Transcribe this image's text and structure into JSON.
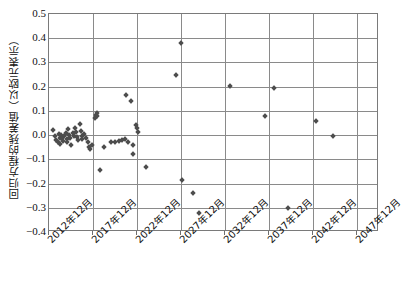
{
  "chart_data": {
    "type": "scatter",
    "title": "",
    "xlabel": "",
    "ylabel": "回归方程的残差值（以欧元表示）",
    "ylim": [
      -0.4,
      0.5
    ],
    "yticks": [
      "0.5",
      "0.4",
      "0.3",
      "0.2",
      "0.1",
      "0.0",
      "-0.1",
      "-0.2",
      "-0.3",
      "-0.4"
    ],
    "ytick_values": [
      0.5,
      0.4,
      0.3,
      0.2,
      0.1,
      0.0,
      -0.1,
      -0.2,
      -0.3,
      -0.4
    ],
    "xticks": [
      "2012年12月",
      "2017年12月",
      "2022年12月",
      "2027年12月",
      "2032年12月",
      "2037年12月",
      "2042年12月",
      "2047年12月"
    ],
    "xtick_values": [
      2012,
      2017,
      2022,
      2027,
      2032,
      2037,
      2042,
      2047
    ],
    "xlim": [
      2012,
      2049.5
    ],
    "grid": true,
    "legend": "none",
    "marker": "diamond",
    "marker_color": "#4d4d4d",
    "series": [
      {
        "name": "残差",
        "points": [
          [
            2012.5,
            0.02
          ],
          [
            2012.7,
            -0.005
          ],
          [
            2012.8,
            -0.02
          ],
          [
            2013.0,
            -0.03
          ],
          [
            2013.1,
            0.005
          ],
          [
            2013.2,
            -0.012
          ],
          [
            2013.3,
            -0.038
          ],
          [
            2013.4,
            0.0
          ],
          [
            2013.5,
            -0.01
          ],
          [
            2013.6,
            -0.025
          ],
          [
            2013.7,
            -0.002
          ],
          [
            2013.9,
            0.01
          ],
          [
            2014.0,
            -0.015
          ],
          [
            2014.1,
            -0.03
          ],
          [
            2014.2,
            0.025
          ],
          [
            2014.3,
            0.002
          ],
          [
            2014.4,
            -0.012
          ],
          [
            2014.5,
            -0.04
          ],
          [
            2014.7,
            0.008
          ],
          [
            2014.8,
            -0.005
          ],
          [
            2015.0,
            0.03
          ],
          [
            2015.1,
            0.012
          ],
          [
            2015.2,
            -0.008
          ],
          [
            2015.3,
            -0.022
          ],
          [
            2015.5,
            0.045
          ],
          [
            2015.6,
            0.018
          ],
          [
            2015.7,
            -0.002
          ],
          [
            2015.8,
            -0.018
          ],
          [
            2016.0,
            0.005
          ],
          [
            2016.2,
            -0.012
          ],
          [
            2016.4,
            -0.03
          ],
          [
            2016.5,
            -0.048
          ],
          [
            2016.7,
            -0.058
          ],
          [
            2016.9,
            -0.04
          ],
          [
            2017.2,
            0.072
          ],
          [
            2017.3,
            0.085
          ],
          [
            2017.4,
            0.09
          ],
          [
            2017.5,
            0.078
          ],
          [
            2017.8,
            -0.145
          ],
          [
            2018.3,
            -0.048
          ],
          [
            2019.0,
            -0.03
          ],
          [
            2019.5,
            -0.028
          ],
          [
            2019.9,
            -0.025
          ],
          [
            2020.3,
            -0.022
          ],
          [
            2020.6,
            -0.018
          ],
          [
            2020.8,
            0.165
          ],
          [
            2021.0,
            -0.03
          ],
          [
            2021.3,
            0.14
          ],
          [
            2021.5,
            -0.04
          ],
          [
            2021.6,
            -0.078
          ],
          [
            2021.9,
            0.04
          ],
          [
            2022.0,
            0.03
          ],
          [
            2022.1,
            0.012
          ],
          [
            2023.0,
            -0.132
          ],
          [
            2026.4,
            0.25
          ],
          [
            2027.0,
            0.38
          ],
          [
            2027.1,
            -0.185
          ],
          [
            2028.4,
            -0.24
          ],
          [
            2029.1,
            -0.322
          ],
          [
            2032.6,
            0.202
          ],
          [
            2036.5,
            0.08
          ],
          [
            2037.6,
            0.195
          ],
          [
            2039.2,
            -0.3
          ],
          [
            2042.3,
            0.06
          ],
          [
            2044.3,
            -0.002
          ]
        ]
      }
    ]
  },
  "axes": {
    "y_label_text": "回归方程的残差值（以欧元表示）"
  }
}
